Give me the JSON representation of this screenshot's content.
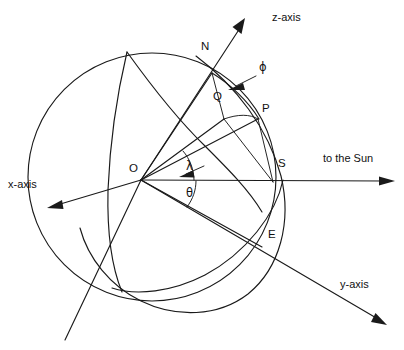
{
  "figure": {
    "title_visible": false,
    "background_color": "#ffffff",
    "line_color": "#1a1a1a"
  },
  "axes": [
    {
      "key": "z",
      "label": "z-axis",
      "direction": "up-right",
      "label_x": 276,
      "label_y": 16
    },
    {
      "key": "y",
      "label": "y-axis",
      "direction": "down-right",
      "label_x": 344,
      "label_y": 284
    },
    {
      "key": "x",
      "label": "x-axis",
      "direction": "down-left",
      "label_x": 12,
      "label_y": 184
    }
  ],
  "sun_ray": {
    "label": "to the Sun",
    "label_x": 327,
    "label_y": 158,
    "direction": "right"
  },
  "points": [
    {
      "key": "O",
      "label": "O",
      "role": "origin-center",
      "x": 141,
      "y": 180,
      "label_x": 129,
      "label_y": 168
    },
    {
      "key": "N",
      "label": "N",
      "role": "north-pole",
      "x": 212,
      "y": 73,
      "label_x": 201,
      "label_y": 46
    },
    {
      "key": "Q",
      "label": "Q",
      "role": "meridian-intersection",
      "x": 224,
      "y": 119,
      "label_x": 213,
      "label_y": 96
    },
    {
      "key": "P",
      "label": "P",
      "role": "surface-point",
      "x": 258,
      "y": 119,
      "label_x": 263,
      "label_y": 108
    },
    {
      "key": "S",
      "label": "S",
      "role": "subsolar-point",
      "x": 273,
      "y": 182,
      "label_x": 278,
      "label_y": 163
    },
    {
      "key": "E",
      "label": "E",
      "role": "equator-point",
      "x": 262,
      "y": 247,
      "label_x": 269,
      "label_y": 234
    }
  ],
  "angles": [
    {
      "key": "phi",
      "symbol": "ϕ",
      "name": "phi",
      "description": "arc from N toward P",
      "label_x": 262,
      "label_y": 68
    },
    {
      "key": "lambda",
      "symbol": "λ",
      "name": "lambda",
      "description": "angle at O above Sun line",
      "label_x": 188,
      "label_y": 172
    },
    {
      "key": "theta",
      "symbol": "θ",
      "name": "theta",
      "description": "angle at O below Sun line",
      "label_x": 188,
      "label_y": 193
    }
  ]
}
